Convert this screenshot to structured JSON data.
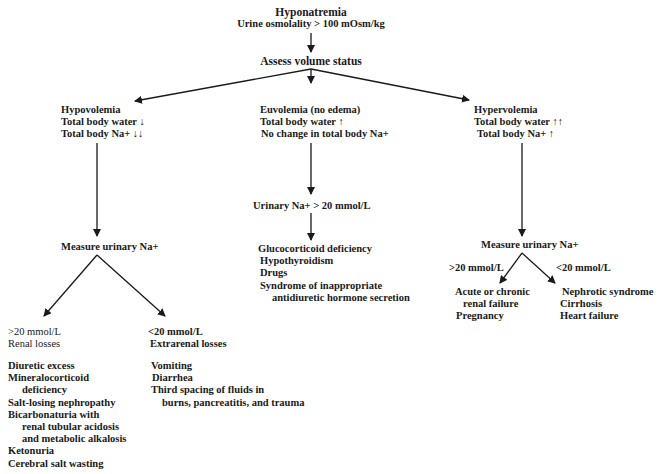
{
  "root": {
    "title": "Hyponatremia",
    "subtitle": "Urine osmolality > 100 mOsm/kg"
  },
  "assess": {
    "label": "Assess volume status"
  },
  "hypovolemia": {
    "title": "Hypovolemia",
    "line1": "Total body water ↓",
    "line2": "Total body Na+ ↓↓",
    "measure": "Measure urinary Na+",
    "renal": {
      "threshold": ">20 mmol/L",
      "label": "Renal losses",
      "causes": [
        "Diuretic excess",
        "Mineralocorticoid",
        "deficiency",
        "Salt-losing nephropathy",
        "Bicarbonaturia with",
        "renal tubular acidosis",
        "and metabolic alkalosis",
        "Ketonuria",
        "Cerebral salt wasting"
      ]
    },
    "extrarenal": {
      "threshold": "<20 mmol/L",
      "label": "Extrarenal losses",
      "causes": [
        "Vomiting",
        "Diarrhea",
        "Third spacing of fluids in",
        "burns, pancreatitis, and trauma"
      ]
    }
  },
  "euvolemia": {
    "title": "Euvolemia (no edema)",
    "line1": "Total body water ↑",
    "line2": "No change in total body Na+",
    "urinary": "Urinary Na+ > 20 mmol/L",
    "causes": [
      "Glucocorticoid deficiency",
      "Hypothyroidism",
      "Drugs",
      "Syndrome of inappropriate",
      "antidiuretic hormone secretion"
    ]
  },
  "hypervolemia": {
    "title": "Hypervolemia",
    "line1": "Total body water ↑↑",
    "line2": "Total body Na+ ↑",
    "measure": "Measure urinary Na+",
    "high": {
      "threshold": ">20 mmol/L",
      "causes": [
        "Acute or chronic",
        "renal failure",
        "Pregnancy"
      ]
    },
    "low": {
      "threshold": "<20 mmol/L",
      "causes": [
        "Nephrotic syndrome",
        "Cirrhosis",
        "Heart failure"
      ]
    }
  },
  "colors": {
    "ink": "#1a1a1a",
    "background": "#ffffff"
  }
}
